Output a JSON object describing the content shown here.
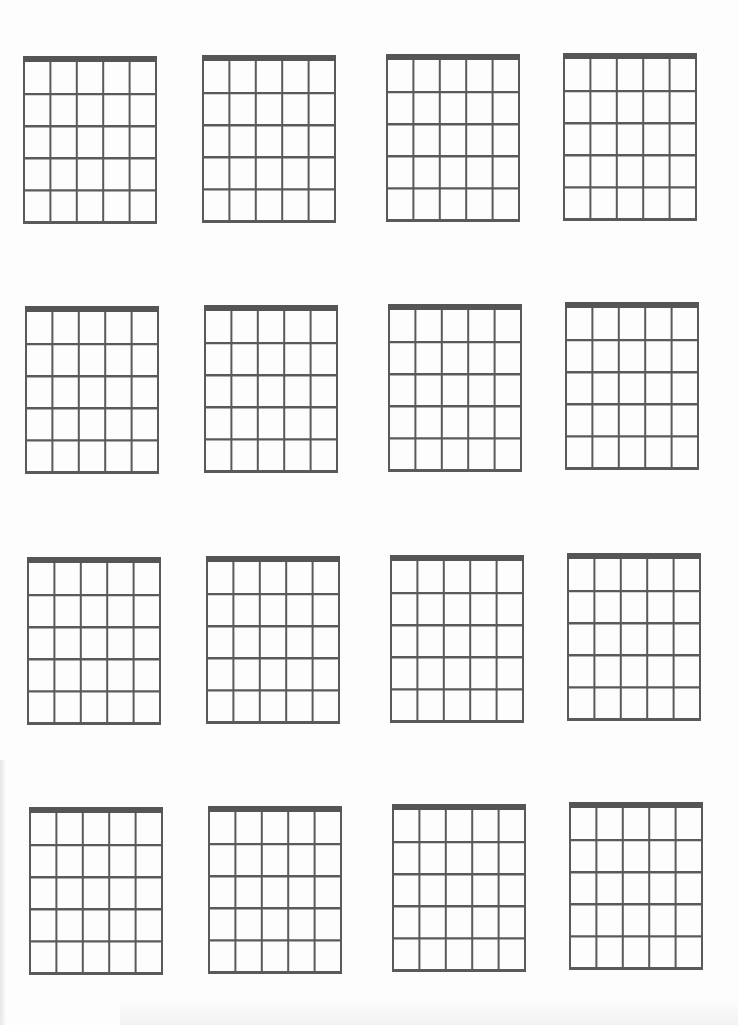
{
  "page": {
    "type": "blank chord diagram sheet",
    "rows": 4,
    "columns": 4,
    "background": "#fdfdfd",
    "line_color": "#5a5a5a",
    "nut_color": "#555555"
  },
  "diagram_spec": {
    "strings": 6,
    "frets": 5,
    "has_nut": true,
    "width": 134,
    "height": 168
  },
  "diagrams": [
    {
      "id": "r1c1",
      "x": 23,
      "y": 56
    },
    {
      "id": "r1c2",
      "x": 202,
      "y": 55
    },
    {
      "id": "r1c3",
      "x": 386,
      "y": 54
    },
    {
      "id": "r1c4",
      "x": 563,
      "y": 53
    },
    {
      "id": "r2c1",
      "x": 25,
      "y": 306
    },
    {
      "id": "r2c2",
      "x": 204,
      "y": 305
    },
    {
      "id": "r2c3",
      "x": 388,
      "y": 304
    },
    {
      "id": "r2c4",
      "x": 565,
      "y": 302
    },
    {
      "id": "r3c1",
      "x": 27,
      "y": 557
    },
    {
      "id": "r3c2",
      "x": 206,
      "y": 556
    },
    {
      "id": "r3c3",
      "x": 390,
      "y": 555
    },
    {
      "id": "r3c4",
      "x": 567,
      "y": 553
    },
    {
      "id": "r4c1",
      "x": 29,
      "y": 807
    },
    {
      "id": "r4c2",
      "x": 208,
      "y": 806
    },
    {
      "id": "r4c3",
      "x": 392,
      "y": 804
    },
    {
      "id": "r4c4",
      "x": 569,
      "y": 802
    }
  ]
}
